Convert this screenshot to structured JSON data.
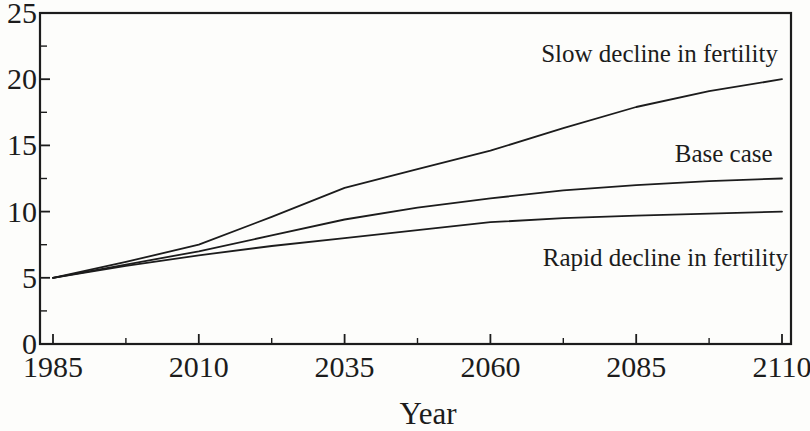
{
  "figure": {
    "background_color": "#fdfdfb",
    "ink_color": "#1c1c1c"
  },
  "chart_data": {
    "type": "line",
    "title": "",
    "xlabel": "Year",
    "ylabel": "",
    "xlim": [
      1985,
      2110
    ],
    "ylim": [
      0,
      25
    ],
    "grid": false,
    "legend_position": "inline-annotations",
    "x": [
      1985,
      1997.5,
      2010,
      2022.5,
      2035,
      2047.5,
      2060,
      2072.5,
      2085,
      2097.5,
      2110
    ],
    "series": [
      {
        "name": "Slow decline in fertility",
        "values": [
          5,
          6.2,
          7.5,
          9.6,
          11.8,
          13.2,
          14.6,
          16.3,
          17.9,
          19.1,
          20
        ]
      },
      {
        "name": "Base case",
        "values": [
          5,
          6.0,
          7.0,
          8.2,
          9.4,
          10.3,
          11.0,
          11.6,
          12.0,
          12.3,
          12.5
        ]
      },
      {
        "name": "Rapid decline in fertility",
        "values": [
          5,
          5.9,
          6.7,
          7.4,
          8.0,
          8.6,
          9.2,
          9.5,
          9.7,
          9.85,
          10
        ]
      }
    ],
    "x_ticks": [
      1985,
      2010,
      2035,
      2060,
      2085,
      2110
    ],
    "x_minor_ticks": [
      1997.5,
      2022.5,
      2047.5,
      2072.5,
      2097.5
    ],
    "y_ticks": [
      0,
      5,
      10,
      15,
      20,
      25
    ],
    "y_minor_ticks": [
      2.5,
      7.5,
      12.5,
      17.5,
      22.5
    ],
    "annotations": [
      {
        "text": "Slow decline in fertility",
        "year": 2089,
        "value": 22.0
      },
      {
        "text": "Base case",
        "year": 2100,
        "value": 14.4
      },
      {
        "text": "Rapid decline in fertility",
        "year": 2090,
        "value": 6.6
      }
    ],
    "line_color": "#1c1c1c"
  }
}
